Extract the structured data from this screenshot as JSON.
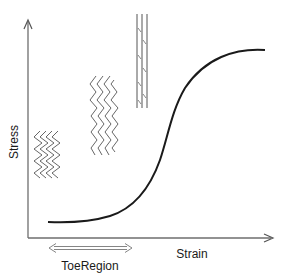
{
  "diagram": {
    "type": "stress-strain-curve",
    "axes": {
      "x_label": "Strain",
      "y_label": "Stress"
    },
    "region_label": "ToeRegion",
    "fiber_states": [
      {
        "name": "crimped",
        "position": "toe region"
      },
      {
        "name": "partially-straightened",
        "position": "linear region"
      },
      {
        "name": "straight",
        "position": "top"
      }
    ],
    "colors": {
      "axis": "#6e6e6e",
      "curve": "#1a1a1a",
      "fiber": "#555555",
      "text": "#1a1a1a"
    }
  }
}
